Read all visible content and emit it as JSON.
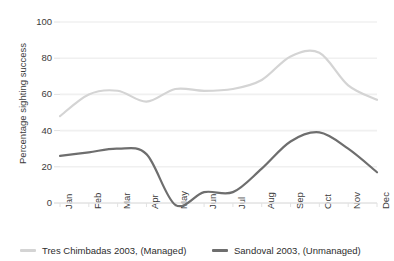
{
  "title": "",
  "axes": {
    "y_label": "Percentage sighting success",
    "y_ticks": [
      "0",
      "20",
      "40",
      "60",
      "80",
      "100"
    ],
    "x_ticks": [
      "Jan",
      "Feb",
      "Mar",
      "Apr",
      "May",
      "Jun",
      "Jul",
      "Aug",
      "Sep",
      "Oct",
      "Nov",
      "Dec"
    ]
  },
  "legend": {
    "items": [
      {
        "label": "Tres Chimbadas 2003, (Managed)",
        "color": "#d4d4d4"
      },
      {
        "label": "Sandoval 2003, (Unmanaged)",
        "color": "#6e6e6e"
      }
    ]
  },
  "chart_data": {
    "type": "line",
    "title": "",
    "xlabel": "",
    "ylabel": "Percentage sighting success",
    "categories": [
      "Jan",
      "Feb",
      "Mar",
      "Apr",
      "May",
      "Jun",
      "Jul",
      "Aug",
      "Sep",
      "Oct",
      "Nov",
      "Dec"
    ],
    "ylim": [
      0,
      100
    ],
    "yticks": [
      0,
      20,
      40,
      60,
      80,
      100
    ],
    "grid": "horizontal",
    "legend_position": "bottom",
    "series": [
      {
        "name": "Tres Chimbadas 2003, (Managed)",
        "color": "#d4d4d4",
        "values": [
          48,
          60,
          62,
          56,
          63,
          62,
          63,
          68,
          81,
          83,
          65,
          57
        ]
      },
      {
        "name": "Sandoval 2003, (Unmanaged)",
        "color": "#6e6e6e",
        "values": [
          26,
          28,
          30,
          27,
          -1,
          6,
          6,
          19,
          34,
          39,
          30,
          17
        ]
      }
    ]
  },
  "style": {
    "grid_color": "#f0f0f0",
    "axis_color": "#e2e2e2",
    "text_color": "#3b3b3b",
    "background": "#ffffff"
  }
}
